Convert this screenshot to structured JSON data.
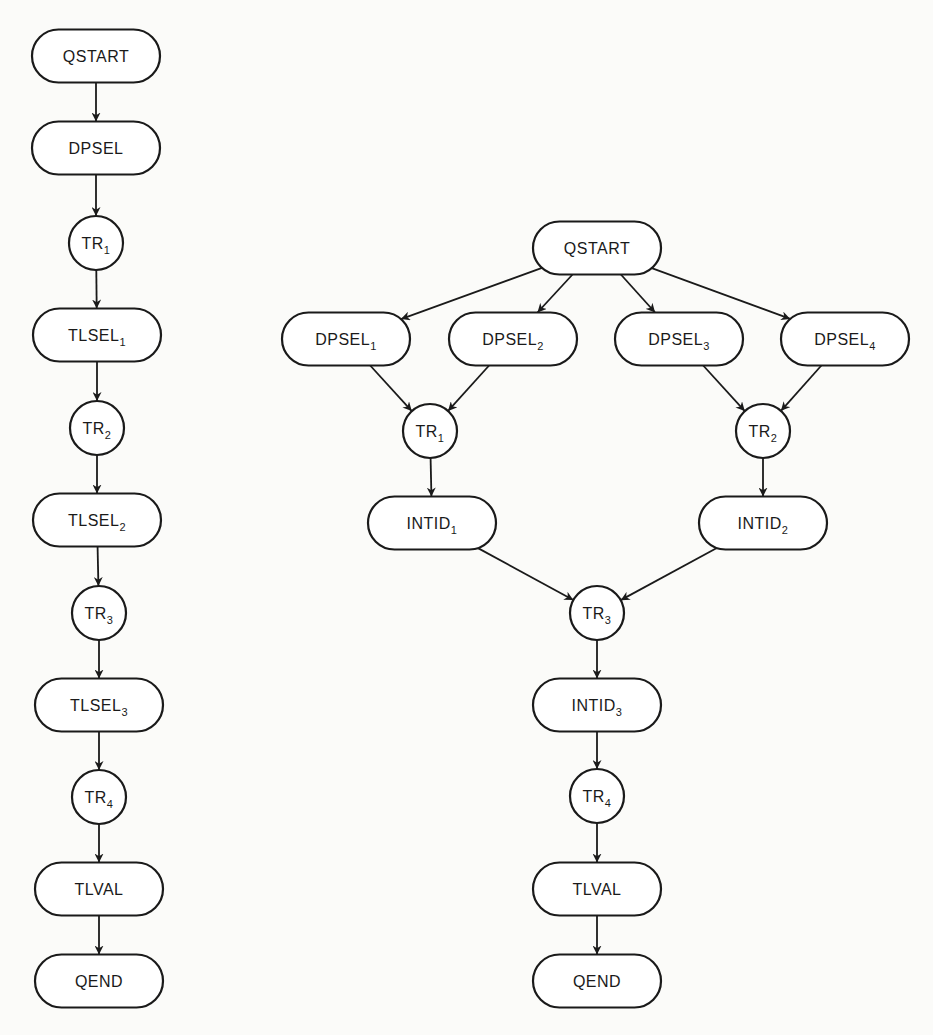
{
  "diagram": {
    "colors": {
      "line": "#1a1a1a",
      "fill": "#ffffff",
      "background": "#fbfbf9"
    },
    "left_flow": {
      "nodes": [
        {
          "id": "L_QSTART",
          "label": "QSTART",
          "sub": "",
          "shape": "terminal",
          "cx": 96,
          "cy": 56
        },
        {
          "id": "L_DPSEL",
          "label": "DPSEL",
          "sub": "",
          "shape": "terminal",
          "cx": 96,
          "cy": 148
        },
        {
          "id": "L_TR1",
          "label": "TR",
          "sub": "1",
          "shape": "circle",
          "cx": 96,
          "cy": 243
        },
        {
          "id": "L_TLSEL1",
          "label": "TLSEL",
          "sub": "1",
          "shape": "terminal",
          "cx": 97,
          "cy": 335
        },
        {
          "id": "L_TR2",
          "label": "TR",
          "sub": "2",
          "shape": "circle",
          "cx": 97,
          "cy": 428
        },
        {
          "id": "L_TLSEL2",
          "label": "TLSEL",
          "sub": "2",
          "shape": "terminal",
          "cx": 97,
          "cy": 520
        },
        {
          "id": "L_TR3",
          "label": "TR",
          "sub": "3",
          "shape": "circle",
          "cx": 99,
          "cy": 613
        },
        {
          "id": "L_TLSEL3",
          "label": "TLSEL",
          "sub": "3",
          "shape": "terminal",
          "cx": 99,
          "cy": 705
        },
        {
          "id": "L_TR4",
          "label": "TR",
          "sub": "4",
          "shape": "circle",
          "cx": 99,
          "cy": 797
        },
        {
          "id": "L_TLVAL",
          "label": "TLVAL",
          "sub": "",
          "shape": "terminal",
          "cx": 99,
          "cy": 889
        },
        {
          "id": "L_QEND",
          "label": "QEND",
          "sub": "",
          "shape": "terminal",
          "cx": 99,
          "cy": 981
        }
      ],
      "edges": [
        [
          "L_QSTART",
          "L_DPSEL"
        ],
        [
          "L_DPSEL",
          "L_TR1"
        ],
        [
          "L_TR1",
          "L_TLSEL1"
        ],
        [
          "L_TLSEL1",
          "L_TR2"
        ],
        [
          "L_TR2",
          "L_TLSEL2"
        ],
        [
          "L_TLSEL2",
          "L_TR3"
        ],
        [
          "L_TR3",
          "L_TLSEL3"
        ],
        [
          "L_TLSEL3",
          "L_TR4"
        ],
        [
          "L_TR4",
          "L_TLVAL"
        ],
        [
          "L_TLVAL",
          "L_QEND"
        ]
      ]
    },
    "right_flow": {
      "nodes": [
        {
          "id": "R_QSTART",
          "label": "QSTART",
          "sub": "",
          "shape": "terminal",
          "cx": 597,
          "cy": 248
        },
        {
          "id": "R_DPSEL1",
          "label": "DPSEL",
          "sub": "1",
          "shape": "terminal",
          "cx": 346,
          "cy": 339
        },
        {
          "id": "R_DPSEL2",
          "label": "DPSEL",
          "sub": "2",
          "shape": "terminal",
          "cx": 513,
          "cy": 339
        },
        {
          "id": "R_DPSEL3",
          "label": "DPSEL",
          "sub": "3",
          "shape": "terminal",
          "cx": 679,
          "cy": 339
        },
        {
          "id": "R_DPSEL4",
          "label": "DPSEL",
          "sub": "4",
          "shape": "terminal",
          "cx": 845,
          "cy": 339
        },
        {
          "id": "R_TR1",
          "label": "TR",
          "sub": "1",
          "shape": "circle",
          "cx": 430,
          "cy": 431
        },
        {
          "id": "R_TR2",
          "label": "TR",
          "sub": "2",
          "shape": "circle",
          "cx": 763,
          "cy": 431
        },
        {
          "id": "R_INTID1",
          "label": "INTID",
          "sub": "1",
          "shape": "terminal",
          "cx": 432,
          "cy": 523
        },
        {
          "id": "R_INTID2",
          "label": "INTID",
          "sub": "2",
          "shape": "terminal",
          "cx": 763,
          "cy": 523
        },
        {
          "id": "R_TR3",
          "label": "TR",
          "sub": "3",
          "shape": "circle",
          "cx": 597,
          "cy": 613
        },
        {
          "id": "R_INTID3",
          "label": "INTID",
          "sub": "3",
          "shape": "terminal",
          "cx": 597,
          "cy": 705
        },
        {
          "id": "R_TR4",
          "label": "TR",
          "sub": "4",
          "shape": "circle",
          "cx": 597,
          "cy": 796
        },
        {
          "id": "R_TLVAL",
          "label": "TLVAL",
          "sub": "",
          "shape": "terminal",
          "cx": 597,
          "cy": 889
        },
        {
          "id": "R_QEND",
          "label": "QEND",
          "sub": "",
          "shape": "terminal",
          "cx": 597,
          "cy": 981
        }
      ],
      "edges": [
        [
          "R_QSTART",
          "R_DPSEL1"
        ],
        [
          "R_QSTART",
          "R_DPSEL2"
        ],
        [
          "R_QSTART",
          "R_DPSEL3"
        ],
        [
          "R_QSTART",
          "R_DPSEL4"
        ],
        [
          "R_DPSEL1",
          "R_TR1"
        ],
        [
          "R_DPSEL2",
          "R_TR1"
        ],
        [
          "R_DPSEL3",
          "R_TR2"
        ],
        [
          "R_DPSEL4",
          "R_TR2"
        ],
        [
          "R_TR1",
          "R_INTID1"
        ],
        [
          "R_TR2",
          "R_INTID2"
        ],
        [
          "R_INTID1",
          "R_TR3"
        ],
        [
          "R_INTID2",
          "R_TR3"
        ],
        [
          "R_TR3",
          "R_INTID3"
        ],
        [
          "R_INTID3",
          "R_TR4"
        ],
        [
          "R_TR4",
          "R_TLVAL"
        ],
        [
          "R_TLVAL",
          "R_QEND"
        ]
      ]
    }
  },
  "shapes": {
    "terminal": {
      "width": 128,
      "height": 53
    },
    "circle": {
      "radius": 27
    }
  }
}
